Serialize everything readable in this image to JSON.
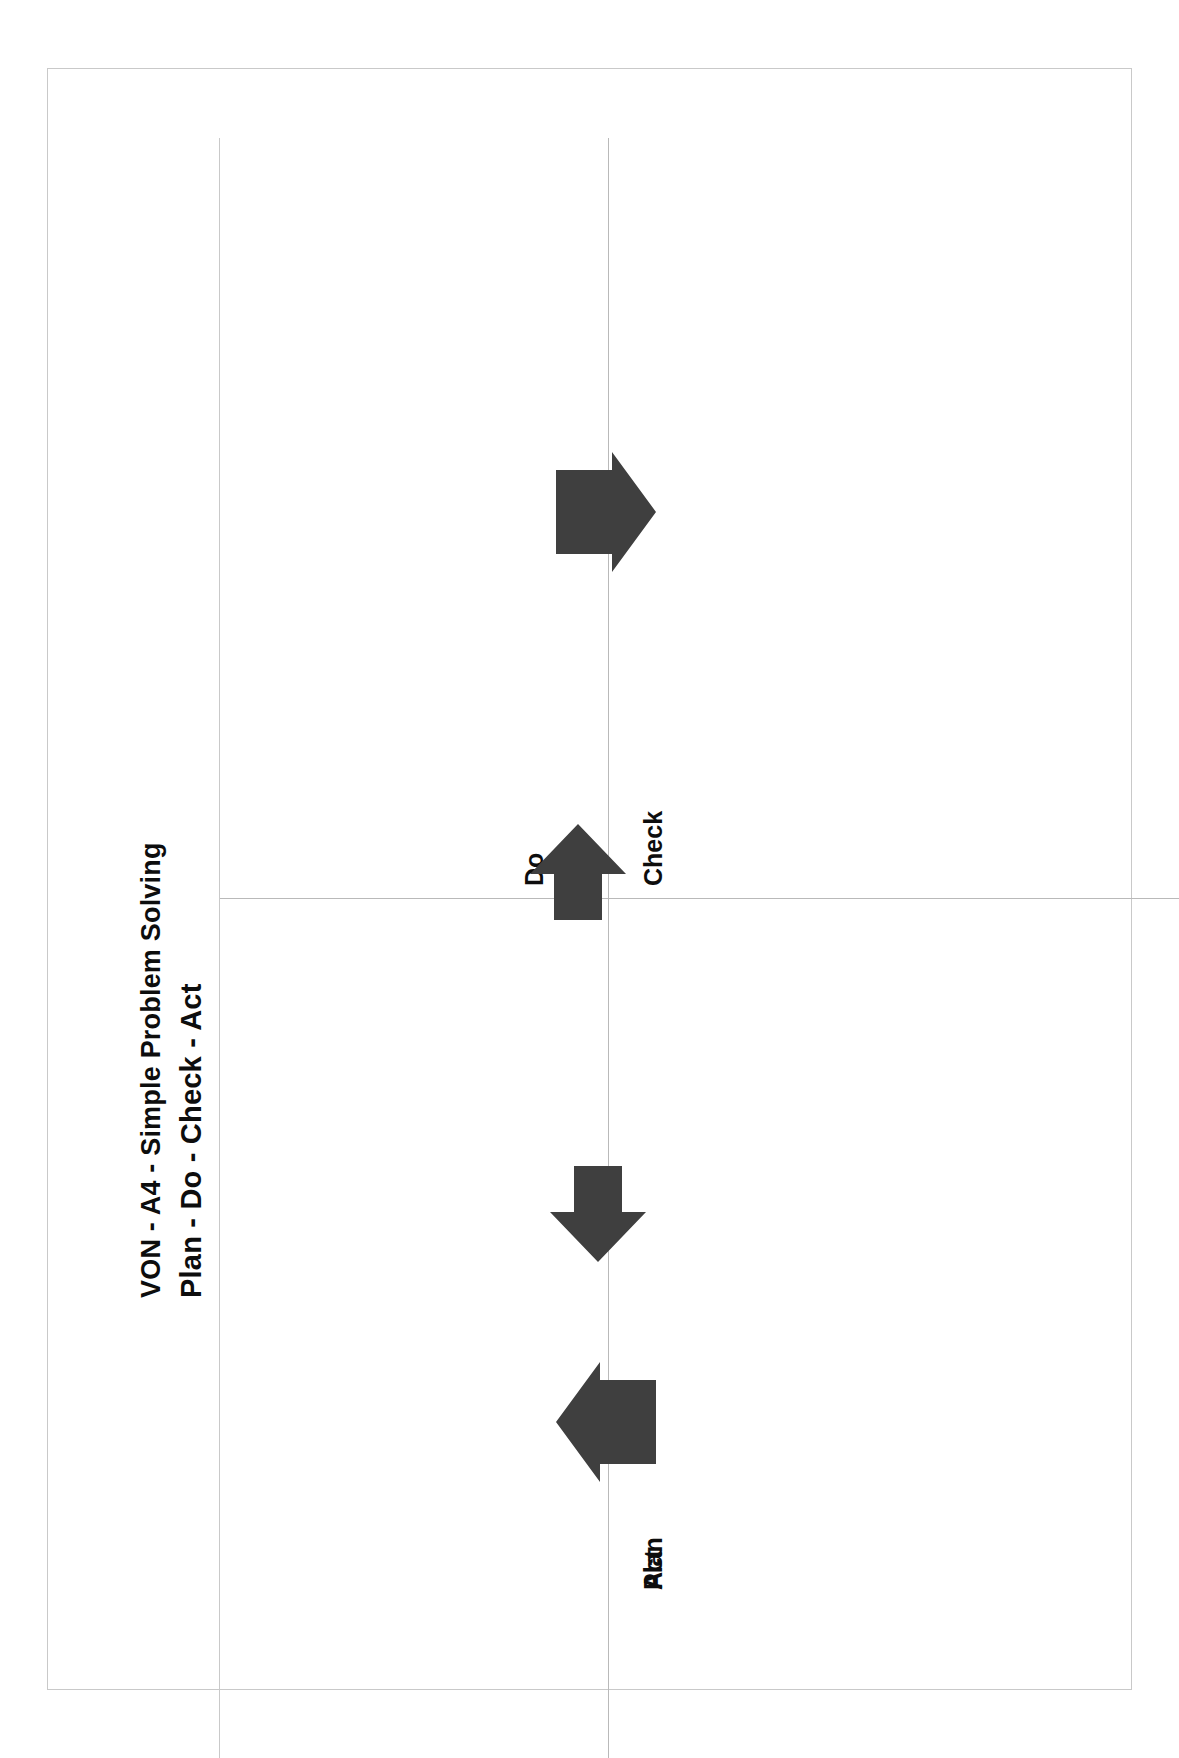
{
  "document": {
    "title_line_1": "VON - A4 - Simple Problem Solving",
    "title_line_2": "Plan - Do - Check - Act",
    "background_color": "#ffffff",
    "border_color": "#c9c9c9",
    "text_color": "#0d0d0d"
  },
  "quadrants": [
    {
      "id": "plan",
      "label": "Plan",
      "position": "top-left"
    },
    {
      "id": "do",
      "label": "Do",
      "position": "top-right"
    },
    {
      "id": "check",
      "label": "Check",
      "position": "bottom-right"
    },
    {
      "id": "act",
      "label": "Act",
      "position": "bottom-left"
    }
  ],
  "arrows": [
    {
      "id": "arrow-plan-to-do",
      "direction": "up",
      "color": "#3f3f3f"
    },
    {
      "id": "arrow-do-to-check",
      "direction": "right",
      "color": "#3f3f3f"
    },
    {
      "id": "arrow-check-to-act",
      "direction": "down",
      "color": "#3f3f3f"
    },
    {
      "id": "arrow-act-to-plan",
      "direction": "left",
      "color": "#3f3f3f"
    }
  ],
  "colors": {
    "arrow_fill": "#3f3f3f",
    "rule": "#b9b9b9",
    "frame": "#c9c9c9"
  }
}
